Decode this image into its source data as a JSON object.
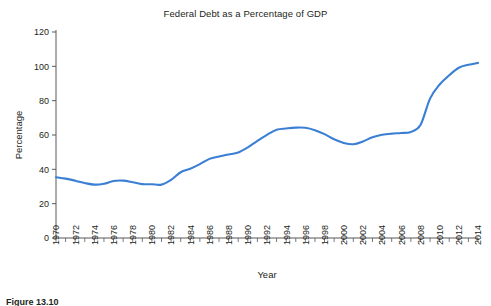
{
  "chart_data": {
    "type": "line",
    "title": "Federal Debt as a Percentage of GDP",
    "xlabel": "Year",
    "ylabel": "Percentage",
    "xlim": [
      1970,
      2014
    ],
    "ylim": [
      0,
      120
    ],
    "ytick_values": [
      0,
      20,
      40,
      60,
      80,
      100,
      120
    ],
    "ytick_labels": [
      "0",
      "20",
      "40",
      "60",
      "80",
      "100",
      "120"
    ],
    "xtick_labels": [
      "1970",
      "1972",
      "1974",
      "1976",
      "1978",
      "1980",
      "1982",
      "1984",
      "1986",
      "1988",
      "1990",
      "1992",
      "1994",
      "1996",
      "1998",
      "2000",
      "2002",
      "2004",
      "2006",
      "2008",
      "2010",
      "2012",
      "2014"
    ],
    "xtick_step": 2,
    "minor_tick_step": 1,
    "grid": false,
    "legend": "none",
    "line_color": "#3b7fd4",
    "axis_color": "#58595b",
    "x": [
      1970,
      1971,
      1972,
      1973,
      1974,
      1975,
      1976,
      1977,
      1978,
      1979,
      1980,
      1981,
      1982,
      1983,
      1984,
      1985,
      1986,
      1987,
      1988,
      1989,
      1990,
      1991,
      1992,
      1993,
      1994,
      1995,
      1996,
      1997,
      1998,
      1999,
      2000,
      2001,
      2002,
      2003,
      2004,
      2005,
      2006,
      2007,
      2008,
      2009,
      2010,
      2011,
      2012,
      2013,
      2014
    ],
    "values": [
      35.4,
      34.6,
      33.4,
      32.0,
      31.1,
      31.6,
      33.2,
      33.4,
      32.5,
      31.4,
      31.3,
      31.1,
      33.9,
      38.3,
      40.3,
      43.0,
      46.1,
      47.5,
      48.6,
      49.8,
      52.8,
      56.6,
      60.1,
      63.1,
      63.8,
      64.3,
      64.2,
      62.8,
      60.5,
      57.5,
      55.4,
      54.6,
      56.2,
      58.7,
      60.1,
      60.8,
      61.2,
      61.8,
      65.8,
      81.2,
      89.4,
      94.8,
      99.2,
      100.9,
      102.0
    ],
    "series_name": "Federal debt as a percentage of GDP",
    "annotations": []
  },
  "figure": {
    "caption": "Figure 13.10"
  }
}
